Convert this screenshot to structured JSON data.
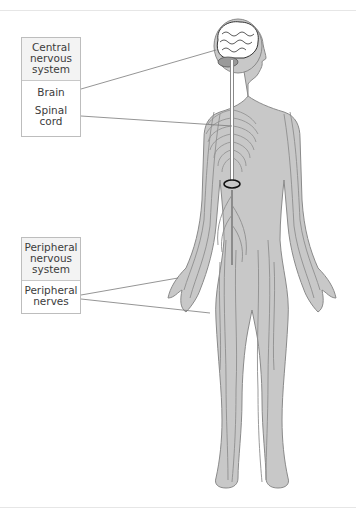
{
  "diagram": {
    "title_visible": false,
    "groups": [
      {
        "heading": "Central nervous system",
        "heading_lines": [
          "Central",
          "nervous",
          "system"
        ],
        "items": [
          {
            "label": "Brain",
            "lines": [
              "Brain"
            ]
          },
          {
            "label": "Spinal cord",
            "lines": [
              "Spinal",
              "cord"
            ]
          }
        ]
      },
      {
        "heading": "Peripheral nervous system",
        "heading_lines": [
          "Peripheral",
          "nervous",
          "system"
        ],
        "items": [
          {
            "label": "Peripheral nerves",
            "lines": [
              "Peripheral",
              "nerves"
            ]
          }
        ]
      }
    ],
    "colors": {
      "body_fill": "#c8c8c8",
      "body_outline": "#8a8a8a",
      "nerve": "#8e8e8e",
      "spinal_cord": "#ffffff",
      "leader_line": "#7a7a7a",
      "label_border": "#bdbdbd",
      "label_heading_bg": "#f3f3f3"
    }
  }
}
